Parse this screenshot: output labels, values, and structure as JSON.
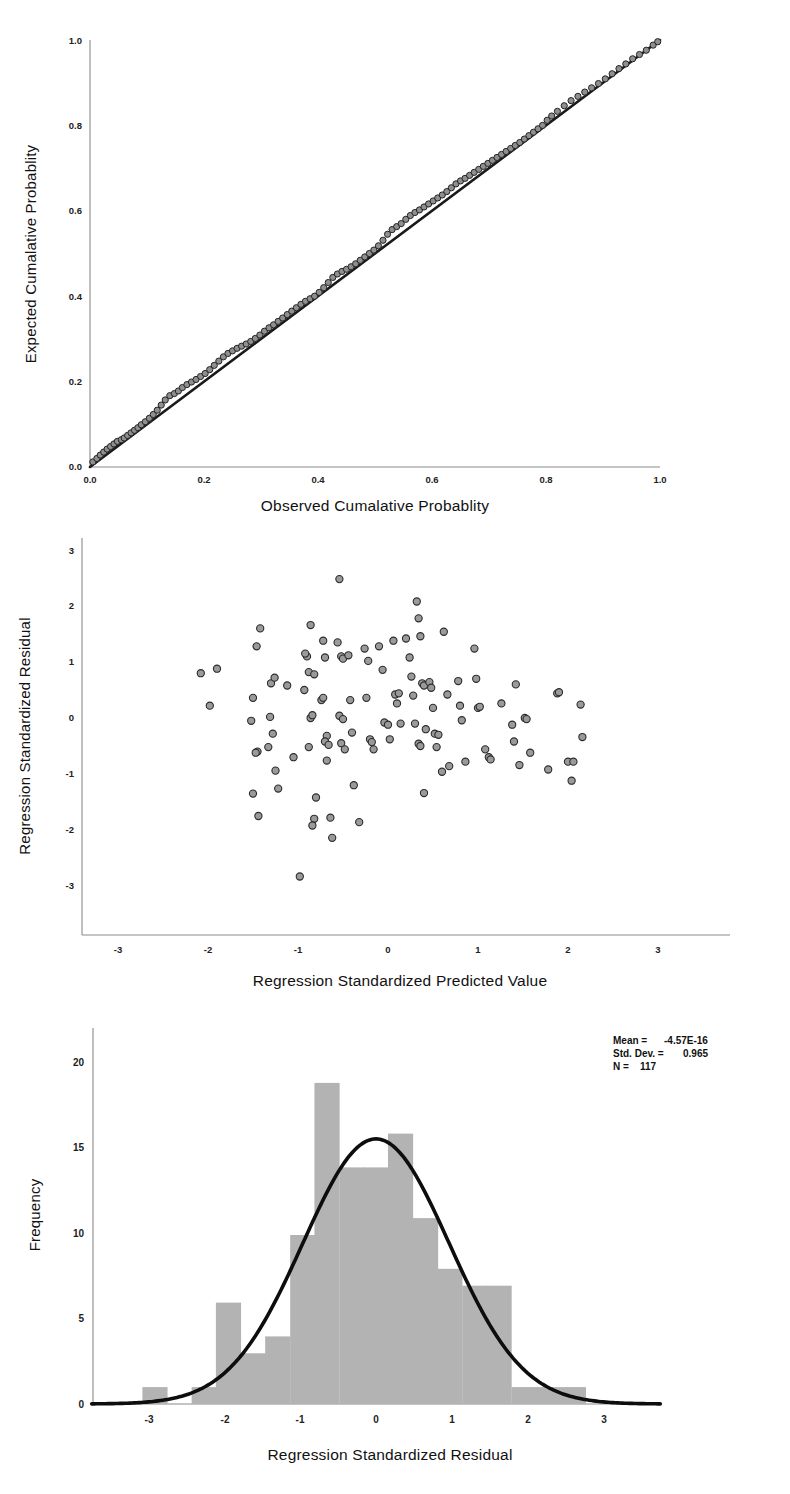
{
  "figure": {
    "kind": "spss-regression-diagnostics",
    "panel_count": 3
  },
  "panels": {
    "pp_plot": {
      "name": "normal-pp-plot",
      "xlabel": "Observed Cumalative Probablity",
      "ylabel": "Expected Cumalative Problity",
      "ylabel_text": "Expected Cumalative Probablity",
      "xticks": [
        "0.0",
        "0.2",
        "0.4",
        "0.6",
        "0.8",
        "1.0"
      ],
      "yticks": [
        "0.0",
        "0.2",
        "0.4",
        "0.6",
        "0.8",
        "1.0"
      ]
    },
    "scatter_plot": {
      "name": "residual-scatter-plot",
      "xlabel": "Regression Standardized Predicted Value",
      "ylabel": "Regression Standardized Residual",
      "xticks": [
        "-3",
        "-2",
        "-1",
        "0",
        "1",
        "2",
        "3"
      ],
      "yticks": [
        "3",
        "2",
        "1",
        "0",
        "-1",
        "-2",
        "-3"
      ]
    },
    "histogram": {
      "name": "residual-histogram",
      "xlabel": "Regression Standardized Residual",
      "ylabel": "Frequency",
      "xticks": [
        "-3",
        "-2",
        "-1",
        "0",
        "1",
        "2",
        "3"
      ],
      "yticks": [
        "0",
        "5",
        "10",
        "15",
        "20"
      ],
      "stats": {
        "mean_label": "Mean =",
        "mean_value": "-4.57E-16",
        "sd_label": "Std. Dev. =",
        "sd_value": "0.965",
        "n_label": "N =",
        "n_value": "117"
      }
    }
  },
  "chart_data": [
    {
      "type": "scatter",
      "name": "Normal P-P Plot of Regression Standardized Residual",
      "title": "",
      "xlabel": "Observed Cumalative Probablity",
      "ylabel": "Expected Cumalative Probablity",
      "xlim": [
        0.0,
        1.0
      ],
      "ylim": [
        0.0,
        1.0
      ],
      "xticks": [
        0.0,
        0.2,
        0.4,
        0.6,
        0.8,
        1.0
      ],
      "yticks": [
        0.0,
        0.2,
        0.4,
        0.6,
        0.8,
        1.0
      ],
      "grid": false,
      "legend": "none",
      "reference_line": {
        "from": [
          0.0,
          0.0
        ],
        "to": [
          1.0,
          1.0
        ]
      },
      "n_points": 117,
      "points": [
        [
          0.005,
          0.012
        ],
        [
          0.012,
          0.02
        ],
        [
          0.018,
          0.028
        ],
        [
          0.024,
          0.035
        ],
        [
          0.03,
          0.042
        ],
        [
          0.036,
          0.048
        ],
        [
          0.042,
          0.054
        ],
        [
          0.048,
          0.06
        ],
        [
          0.055,
          0.064
        ],
        [
          0.06,
          0.068
        ],
        [
          0.066,
          0.074
        ],
        [
          0.072,
          0.08
        ],
        [
          0.078,
          0.086
        ],
        [
          0.084,
          0.092
        ],
        [
          0.09,
          0.099
        ],
        [
          0.097,
          0.106
        ],
        [
          0.104,
          0.114
        ],
        [
          0.111,
          0.123
        ],
        [
          0.118,
          0.133
        ],
        [
          0.125,
          0.145
        ],
        [
          0.132,
          0.157
        ],
        [
          0.14,
          0.167
        ],
        [
          0.148,
          0.172
        ],
        [
          0.155,
          0.178
        ],
        [
          0.162,
          0.186
        ],
        [
          0.17,
          0.193
        ],
        [
          0.178,
          0.199
        ],
        [
          0.186,
          0.205
        ],
        [
          0.194,
          0.212
        ],
        [
          0.202,
          0.219
        ],
        [
          0.21,
          0.228
        ],
        [
          0.218,
          0.238
        ],
        [
          0.226,
          0.248
        ],
        [
          0.234,
          0.258
        ],
        [
          0.242,
          0.266
        ],
        [
          0.25,
          0.272
        ],
        [
          0.258,
          0.278
        ],
        [
          0.266,
          0.283
        ],
        [
          0.274,
          0.288
        ],
        [
          0.282,
          0.294
        ],
        [
          0.29,
          0.301
        ],
        [
          0.298,
          0.309
        ],
        [
          0.306,
          0.318
        ],
        [
          0.314,
          0.326
        ],
        [
          0.322,
          0.333
        ],
        [
          0.33,
          0.341
        ],
        [
          0.338,
          0.349
        ],
        [
          0.346,
          0.357
        ],
        [
          0.354,
          0.365
        ],
        [
          0.362,
          0.373
        ],
        [
          0.37,
          0.381
        ],
        [
          0.378,
          0.388
        ],
        [
          0.386,
          0.394
        ],
        [
          0.394,
          0.4
        ],
        [
          0.402,
          0.409
        ],
        [
          0.41,
          0.42
        ],
        [
          0.418,
          0.432
        ],
        [
          0.426,
          0.444
        ],
        [
          0.434,
          0.452
        ],
        [
          0.442,
          0.458
        ],
        [
          0.45,
          0.463
        ],
        [
          0.458,
          0.469
        ],
        [
          0.466,
          0.476
        ],
        [
          0.474,
          0.484
        ],
        [
          0.482,
          0.492
        ],
        [
          0.49,
          0.5
        ],
        [
          0.498,
          0.508
        ],
        [
          0.506,
          0.518
        ],
        [
          0.514,
          0.531
        ],
        [
          0.522,
          0.545
        ],
        [
          0.53,
          0.556
        ],
        [
          0.538,
          0.563
        ],
        [
          0.546,
          0.57
        ],
        [
          0.554,
          0.58
        ],
        [
          0.562,
          0.589
        ],
        [
          0.57,
          0.596
        ],
        [
          0.578,
          0.602
        ],
        [
          0.586,
          0.609
        ],
        [
          0.594,
          0.616
        ],
        [
          0.602,
          0.623
        ],
        [
          0.61,
          0.63
        ],
        [
          0.618,
          0.637
        ],
        [
          0.626,
          0.645
        ],
        [
          0.634,
          0.654
        ],
        [
          0.642,
          0.663
        ],
        [
          0.65,
          0.67
        ],
        [
          0.658,
          0.676
        ],
        [
          0.666,
          0.683
        ],
        [
          0.674,
          0.69
        ],
        [
          0.682,
          0.697
        ],
        [
          0.69,
          0.704
        ],
        [
          0.698,
          0.711
        ],
        [
          0.706,
          0.718
        ],
        [
          0.714,
          0.725
        ],
        [
          0.722,
          0.732
        ],
        [
          0.73,
          0.739
        ],
        [
          0.738,
          0.746
        ],
        [
          0.746,
          0.753
        ],
        [
          0.754,
          0.76
        ],
        [
          0.762,
          0.768
        ],
        [
          0.77,
          0.776
        ],
        [
          0.778,
          0.784
        ],
        [
          0.786,
          0.792
        ],
        [
          0.794,
          0.8
        ],
        [
          0.802,
          0.812
        ],
        [
          0.81,
          0.822
        ],
        [
          0.82,
          0.833
        ],
        [
          0.832,
          0.846
        ],
        [
          0.844,
          0.858
        ],
        [
          0.856,
          0.868
        ],
        [
          0.868,
          0.878
        ],
        [
          0.88,
          0.888
        ],
        [
          0.892,
          0.898
        ],
        [
          0.904,
          0.909
        ],
        [
          0.916,
          0.921
        ],
        [
          0.928,
          0.933
        ],
        [
          0.94,
          0.944
        ],
        [
          0.952,
          0.956
        ],
        [
          0.964,
          0.966
        ],
        [
          0.976,
          0.976
        ],
        [
          0.988,
          0.988
        ],
        [
          0.996,
          0.996
        ]
      ]
    },
    {
      "type": "scatter",
      "name": "Scatterplot of Standardized Residual vs Standardized Predicted Value",
      "title": "",
      "xlabel": "Regression Standardized Predicted Value",
      "ylabel": "Regression Standardized Residual",
      "xlim": [
        -3.4,
        3.4
      ],
      "ylim": [
        -3.4,
        3.4
      ],
      "xticks": [
        -3,
        -2,
        -1,
        0,
        1,
        2,
        3
      ],
      "yticks": [
        -3,
        -2,
        -1,
        0,
        1,
        2,
        3
      ],
      "grid": false,
      "legend": "none",
      "n_points": 117,
      "points": [
        [
          -2.08,
          0.8
        ],
        [
          -1.9,
          0.88
        ],
        [
          -1.98,
          0.22
        ],
        [
          -1.42,
          1.6
        ],
        [
          -1.46,
          1.28
        ],
        [
          -1.5,
          0.36
        ],
        [
          -1.52,
          -0.05
        ],
        [
          -1.45,
          -0.6
        ],
        [
          -1.47,
          -0.62
        ],
        [
          -1.5,
          -1.35
        ],
        [
          -1.44,
          -1.75
        ],
        [
          -1.3,
          0.62
        ],
        [
          -1.26,
          0.72
        ],
        [
          -1.31,
          0.02
        ],
        [
          -1.28,
          -0.28
        ],
        [
          -1.33,
          -0.52
        ],
        [
          -1.25,
          -0.94
        ],
        [
          -1.22,
          -1.26
        ],
        [
          -1.12,
          0.58
        ],
        [
          -1.05,
          -0.7
        ],
        [
          -0.98,
          -2.83
        ],
        [
          -0.9,
          1.1
        ],
        [
          -0.92,
          1.15
        ],
        [
          -0.86,
          1.66
        ],
        [
          -0.88,
          0.82
        ],
        [
          -0.93,
          0.5
        ],
        [
          -0.82,
          0.78
        ],
        [
          -0.86,
          0.0
        ],
        [
          -0.84,
          0.05
        ],
        [
          -0.88,
          -0.52
        ],
        [
          -0.8,
          -1.42
        ],
        [
          -0.82,
          -1.8
        ],
        [
          -0.84,
          -1.92
        ],
        [
          -0.72,
          1.38
        ],
        [
          -0.7,
          1.08
        ],
        [
          -0.74,
          0.32
        ],
        [
          -0.72,
          0.36
        ],
        [
          -0.68,
          -0.32
        ],
        [
          -0.7,
          -0.42
        ],
        [
          -0.66,
          -0.48
        ],
        [
          -0.68,
          -0.76
        ],
        [
          -0.64,
          -1.78
        ],
        [
          -0.62,
          -2.14
        ],
        [
          -0.56,
          1.35
        ],
        [
          -0.54,
          2.48
        ],
        [
          -0.52,
          1.1
        ],
        [
          -0.5,
          1.06
        ],
        [
          -0.54,
          0.04
        ],
        [
          -0.5,
          -0.02
        ],
        [
          -0.52,
          -0.45
        ],
        [
          -0.48,
          -0.56
        ],
        [
          -0.44,
          1.12
        ],
        [
          -0.42,
          0.32
        ],
        [
          -0.4,
          -0.26
        ],
        [
          -0.38,
          -1.2
        ],
        [
          -0.32,
          -1.86
        ],
        [
          -0.26,
          1.24
        ],
        [
          -0.22,
          1.02
        ],
        [
          -0.24,
          0.36
        ],
        [
          -0.2,
          -0.38
        ],
        [
          -0.18,
          -0.43
        ],
        [
          -0.16,
          -0.56
        ],
        [
          -0.1,
          1.28
        ],
        [
          -0.06,
          0.86
        ],
        [
          -0.04,
          -0.08
        ],
        [
          0.0,
          -0.12
        ],
        [
          0.02,
          -0.38
        ],
        [
          0.06,
          1.38
        ],
        [
          0.08,
          0.42
        ],
        [
          0.1,
          0.26
        ],
        [
          0.12,
          0.44
        ],
        [
          0.14,
          -0.1
        ],
        [
          0.2,
          1.42
        ],
        [
          0.24,
          1.08
        ],
        [
          0.26,
          0.74
        ],
        [
          0.28,
          0.4
        ],
        [
          0.3,
          -0.1
        ],
        [
          0.32,
          2.08
        ],
        [
          0.34,
          1.78
        ],
        [
          0.36,
          1.46
        ],
        [
          0.38,
          0.62
        ],
        [
          0.4,
          0.58
        ],
        [
          0.34,
          -0.46
        ],
        [
          0.36,
          -0.5
        ],
        [
          0.42,
          -0.2
        ],
        [
          0.46,
          0.64
        ],
        [
          0.48,
          0.54
        ],
        [
          0.5,
          0.18
        ],
        [
          0.52,
          -0.28
        ],
        [
          0.54,
          -0.52
        ],
        [
          0.56,
          -0.3
        ],
        [
          0.4,
          -1.34
        ],
        [
          0.62,
          1.54
        ],
        [
          0.66,
          0.42
        ],
        [
          0.6,
          -0.96
        ],
        [
          0.68,
          -0.86
        ],
        [
          0.78,
          0.66
        ],
        [
          0.8,
          0.22
        ],
        [
          0.82,
          -0.04
        ],
        [
          0.86,
          -0.78
        ],
        [
          0.96,
          1.24
        ],
        [
          0.98,
          0.7
        ],
        [
          1.0,
          0.18
        ],
        [
          1.02,
          0.2
        ],
        [
          1.08,
          -0.56
        ],
        [
          1.12,
          -0.7
        ],
        [
          1.14,
          -0.74
        ],
        [
          1.26,
          0.26
        ],
        [
          1.38,
          -0.12
        ],
        [
          1.42,
          0.6
        ],
        [
          1.4,
          -0.42
        ],
        [
          1.46,
          -0.84
        ],
        [
          1.52,
          0.0
        ],
        [
          1.54,
          -0.02
        ],
        [
          1.58,
          -0.62
        ],
        [
          1.78,
          -0.92
        ],
        [
          1.88,
          0.44
        ],
        [
          1.9,
          0.46
        ],
        [
          2.0,
          -0.78
        ],
        [
          2.06,
          -0.78
        ],
        [
          2.04,
          -1.12
        ],
        [
          2.14,
          0.24
        ],
        [
          2.16,
          -0.34
        ]
      ]
    },
    {
      "type": "bar",
      "name": "Histogram of Regression Standardized Residual",
      "title": "",
      "xlabel": "Regression Standardized Residual",
      "ylabel": "Frequency",
      "xlim": [
        -3.75,
        3.75
      ],
      "ylim": [
        0,
        22
      ],
      "xticks": [
        -3,
        -2,
        -1,
        0,
        1,
        2,
        3
      ],
      "yticks": [
        0,
        5,
        10,
        15,
        20
      ],
      "grid": false,
      "legend": "none",
      "bin_width": 0.3243,
      "bin_centers": [
        -2.92,
        -2.6,
        -2.27,
        -1.95,
        -1.62,
        -1.3,
        -0.97,
        -0.65,
        -0.32,
        0.0,
        0.32,
        0.65,
        0.97,
        1.3,
        1.62,
        1.95,
        2.27,
        2.6
      ],
      "categories": [
        "-3.08..-2.76",
        "-2.76..-2.43",
        "-2.43..-2.11",
        "-2.11..-1.78",
        "-1.78..-1.46",
        "-1.46..-1.14",
        "-1.14..-0.81",
        "-0.81..-0.49",
        "-0.49..-0.16",
        "-0.16..0.16",
        "0.16..0.49",
        "0.49..0.81",
        "0.81..1.14",
        "1.14..1.46",
        "1.46..1.79",
        "1.79..2.11",
        "2.11..2.43",
        "2.43..2.76"
      ],
      "values": [
        1,
        0,
        1,
        6,
        3,
        4,
        10,
        19,
        14,
        14,
        16,
        11,
        8,
        7,
        7,
        1,
        1,
        1
      ],
      "overlay": {
        "type": "normal-curve",
        "mean": 0.0,
        "std": 0.965,
        "n": 117,
        "peak_value": 16.2
      },
      "annotations": {
        "Mean": "-4.57E-16",
        "Std. Dev.": "0.965",
        "N": "117"
      }
    }
  ]
}
